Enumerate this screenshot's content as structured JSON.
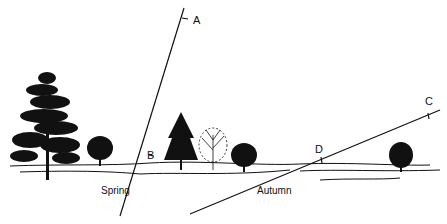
{
  "diagram": {
    "type": "landscape-illustration",
    "colors": {
      "ink": "#111111",
      "background": "#ffffff"
    },
    "labels": {
      "a": "A",
      "b": "B",
      "c": "C",
      "d": "D",
      "spring": "Spring",
      "autumn": "Autumn"
    },
    "lines": [
      {
        "name": "spring-line",
        "from": "A",
        "through": "B",
        "season": "Spring"
      },
      {
        "name": "autumn-line",
        "from": "C",
        "through": "D",
        "season": "Autumn"
      }
    ],
    "trees": [
      {
        "kind": "pine",
        "position": "far-left"
      },
      {
        "kind": "round-deciduous",
        "position": "left"
      },
      {
        "kind": "conifer",
        "position": "center-left"
      },
      {
        "kind": "bare-deciduous",
        "position": "center"
      },
      {
        "kind": "round-deciduous",
        "position": "center-right"
      },
      {
        "kind": "round-deciduous",
        "position": "right"
      }
    ]
  }
}
